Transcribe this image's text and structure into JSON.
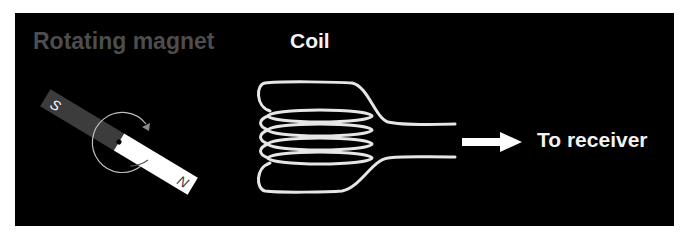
{
  "labels": {
    "magnet": "Rotating magnet",
    "coil": "Coil",
    "receiver": "To receiver"
  },
  "magnet": {
    "south_pole": "S",
    "north_pole": "N",
    "south_color": "#3c3c3c",
    "north_color": "#ffffff"
  },
  "colors": {
    "background": "#000000",
    "magnet_title": "#4d4d4d",
    "text": "#f2f2f2",
    "coil_wire": "#e6e6e6"
  }
}
